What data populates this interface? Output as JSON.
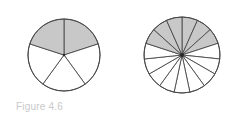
{
  "figure": {
    "caption": "Figure 4.6",
    "caption_color": "#c9c9c9",
    "background_color": "#ffffff",
    "stroke_color": "#4a4a4a",
    "shaded_color": "#c8c8c8",
    "unshaded_color": "#ffffff",
    "diagrams": [
      {
        "name": "five-sector-circle",
        "label": "circle divided into fifths with two fifths shaded",
        "center_x": 64,
        "center_y": 55,
        "radius": 36,
        "total_sectors": 5,
        "shaded_sectors": 2,
        "fraction": "2/5",
        "start_angle_deg": -90,
        "shaded_indices": [
          0,
          4
        ],
        "has_center_dot": true
      },
      {
        "name": "fifteen-sector-circle",
        "label": "circle divided into fifteenths with six fifteenths shaded",
        "center_x": 182,
        "center_y": 55,
        "radius": 38,
        "total_sectors": 15,
        "shaded_sectors": 6,
        "fraction": "6/15",
        "start_angle_deg": -90,
        "shaded_indices": [
          0,
          1,
          2,
          12,
          13,
          14
        ],
        "has_center_dot": true
      }
    ]
  }
}
